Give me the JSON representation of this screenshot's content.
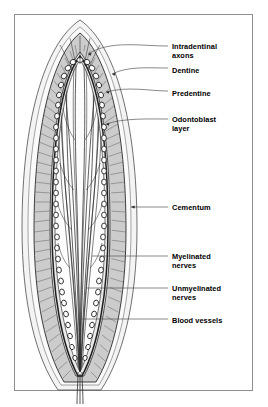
{
  "figure": {
    "frame_color": "#8d8d8d",
    "background": "#ffffff"
  },
  "palette": {
    "outline": "#1a1a1a",
    "cementum_fill": "#f2f2f2",
    "dentine_fill": "#c9c9c9",
    "dentine_hatch": "#6e6e6e",
    "predentine_fill": "#e8e8e8",
    "pulp_fill": "#fdfdfd",
    "odontoblast_fill": "#ffffff",
    "nerve_stroke": "#2b2b2b",
    "leader_line": "#4a4a4a",
    "label_text": "#000000"
  },
  "labels": [
    {
      "id": "intradentinal-axons",
      "text": "Intradentinal\naxons",
      "x": 172,
      "y": 42
    },
    {
      "id": "dentine",
      "text": "Dentine",
      "x": 172,
      "y": 66
    },
    {
      "id": "predentine",
      "text": "Predentine",
      "x": 172,
      "y": 89
    },
    {
      "id": "odontoblast-layer",
      "text": "Odontoblast\nlayer",
      "x": 172,
      "y": 115
    },
    {
      "id": "cementum",
      "text": "Cementum",
      "x": 172,
      "y": 203
    },
    {
      "id": "myelinated-nerves",
      "text": "Myelinated\nnerves",
      "x": 172,
      "y": 252
    },
    {
      "id": "unmyelinated-nerves",
      "text": "Unmyelinated\nnerves",
      "x": 172,
      "y": 284
    },
    {
      "id": "blood-vessels",
      "text": "Blood vessels",
      "x": 172,
      "y": 316
    }
  ],
  "structures": {
    "cementum": "outermost pale band enveloping the tooth",
    "dentine": "broad gray band with radial dentinal tubule hatching",
    "predentine": "thin pale band inside dentine",
    "odontoblast_layer": "single row of white oval cells lining the pulp",
    "pulp": "central cavity containing nerve bundles and vessels",
    "apical_foramen": "narrow root opening where bundles exit"
  },
  "counts": {
    "odontoblast_cells_per_side": 30,
    "dentine_tubules_per_side": 46,
    "pulp_fibers": 22
  }
}
